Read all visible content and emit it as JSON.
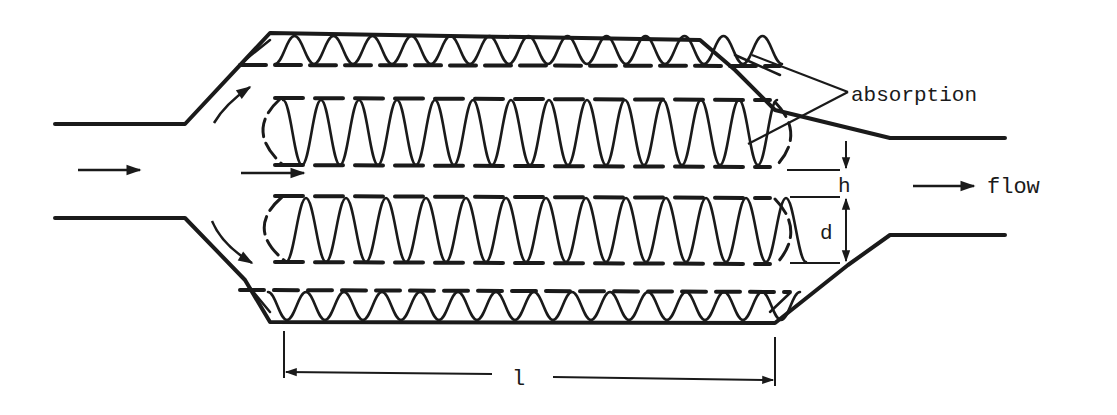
{
  "figure": {
    "type": "parallel-baffle silencer schematic",
    "ink_color": "#1a1a1a",
    "background_color": "#ffffff"
  },
  "labels": {
    "absorption": "absorption",
    "flow": "flow",
    "h": "h",
    "d": "d",
    "l": "l"
  },
  "geometry": {
    "inlet_duct": {
      "x0": 55,
      "x1": 185,
      "y_top": 124,
      "y_bottom": 218
    },
    "outlet_duct": {
      "x0": 890,
      "x1": 1005,
      "y_top": 138,
      "y_bottom": 235
    },
    "housing": {
      "x0": 270,
      "x1": 775,
      "y_top": 33,
      "y_bottom": 322
    },
    "top_liner": {
      "y_outer": 33,
      "y_inner": 65
    },
    "bottom_liner": {
      "y_outer": 322,
      "y_inner": 290
    },
    "splitter_1": {
      "x0": 255,
      "x1": 790,
      "y_top": 98,
      "y_bottom": 165
    },
    "splitter_2": {
      "x0": 255,
      "x1": 790,
      "y_top": 196,
      "y_bottom": 262
    }
  },
  "dimensions": {
    "h": {
      "x": 846,
      "y_top": 165,
      "y_bottom": 196
    },
    "d": {
      "x": 846,
      "y_top": 196,
      "y_bottom": 262
    },
    "l": {
      "x0": 284,
      "x1": 775,
      "y": 375
    }
  },
  "arrows": [
    {
      "name": "inlet-flow-arrow",
      "x0": 78,
      "x1": 142,
      "y": 170
    },
    {
      "name": "center-flow-arrow",
      "x0": 241,
      "x1": 306,
      "y": 173
    },
    {
      "name": "outlet-flow-arrow",
      "x0": 913,
      "x1": 976,
      "y": 186
    }
  ]
}
